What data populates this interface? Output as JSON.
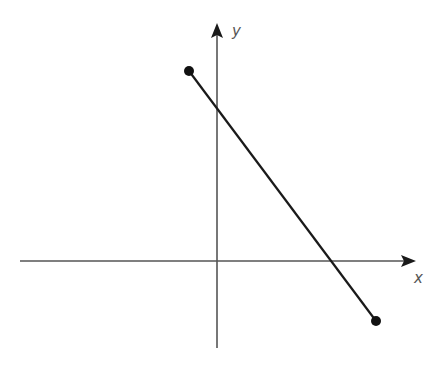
{
  "diagram": {
    "type": "coordinate-plane-line-segment",
    "axes": {
      "x_label": "x",
      "y_label": "y",
      "color": "#555555"
    },
    "segment": {
      "start_point": "upper-left (second quadrant)",
      "end_point": "lower-right (fourth quadrant)",
      "color": "#1a1a1a",
      "crosses": [
        "positive y-axis",
        "positive x-axis"
      ]
    }
  }
}
